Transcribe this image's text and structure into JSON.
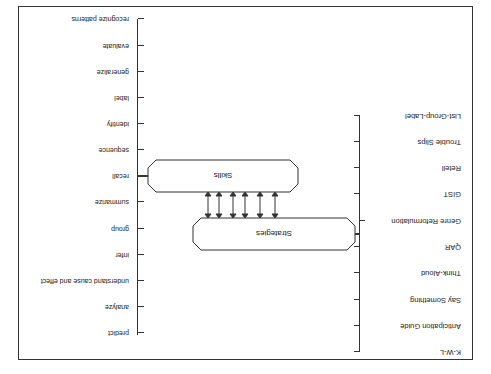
{
  "diagram": {
    "orientation": "rotated 180 degrees",
    "nodes": {
      "skills": {
        "label": "Skills"
      },
      "strategies": {
        "label": "Strategies"
      }
    },
    "skills": [
      "predict",
      "analyze",
      "understand cause and effect",
      "infer",
      "group",
      "summarize",
      "recall",
      "sequence",
      "identify",
      "label",
      "generalize",
      "evaluate",
      "recognize patterns"
    ],
    "strategies": [
      "K-W-L",
      "Anticipation Guide",
      "Say Something",
      "Think-Aloud",
      "QAR",
      "Genre Reformulation",
      "GIST",
      "Retell",
      "Trouble Slips",
      "List-Group-Label"
    ],
    "connector_arrow_count": 6,
    "colors": {
      "line": "#333333",
      "text": "#1a1a1a",
      "background": "#ffffff"
    }
  }
}
